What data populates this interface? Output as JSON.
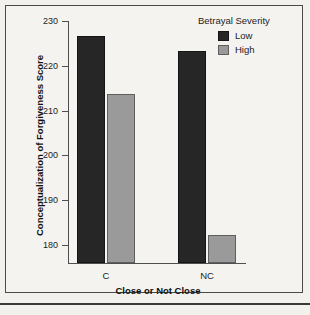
{
  "chart_data": {
    "type": "bar",
    "title": "",
    "xlabel": "Close or Not Close",
    "ylabel": "Conceptualization of Forgiveness Score",
    "categories": [
      "C",
      "NC"
    ],
    "series": [
      {
        "name": "Low",
        "color": "#262626",
        "values": [
          226.6,
          223.3
        ]
      },
      {
        "name": "High",
        "color": "#9a9a9a",
        "values": [
          213.7,
          182.2
        ]
      }
    ],
    "ylim": [
      176,
      230
    ],
    "yticks": [
      180,
      190,
      200,
      210,
      220,
      230
    ],
    "ytick_labels": [
      "180",
      "190",
      "200",
      "210",
      "220",
      "230"
    ],
    "grid": false,
    "legend": {
      "title": "Betrayal Severity",
      "position": "top-right",
      "entries": [
        {
          "label": "Low",
          "color": "#262626"
        },
        {
          "label": "High",
          "color": "#9a9a9a"
        }
      ]
    }
  },
  "figure": {
    "background": "#f2f1ee",
    "frame_color": "#4a4a4a",
    "axis_color": "#4f4f4f",
    "text_color": "#1c1c1c"
  }
}
